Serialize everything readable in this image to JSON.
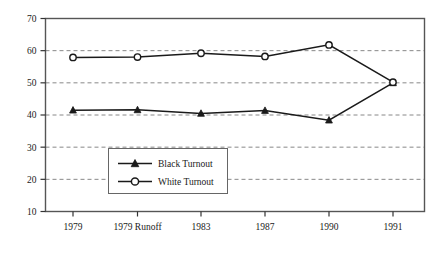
{
  "chart_data": {
    "type": "line",
    "title": "",
    "xlabel": "",
    "ylabel": "",
    "categories": [
      "1979",
      "1979 Runoff",
      "1983",
      "1987",
      "1990",
      "1991"
    ],
    "series": [
      {
        "name": "Black Turnout",
        "marker": "filled-triangle",
        "color": "#1a1a1a",
        "values": [
          41.5,
          41.6,
          40.5,
          41.4,
          38.4,
          50.0
        ]
      },
      {
        "name": "White Turnout",
        "marker": "open-circle",
        "color": "#1a1a1a",
        "values": [
          57.9,
          58.0,
          59.2,
          58.2,
          61.8,
          50.2
        ]
      }
    ],
    "ylim": [
      10,
      70
    ],
    "yticks": [
      10,
      20,
      30,
      40,
      50,
      60,
      70
    ],
    "ytick_labels": [
      "10",
      "20",
      "30",
      "40",
      "50",
      "60",
      "70"
    ],
    "grid": true,
    "grid_style": "dashed",
    "grid_color": "#888888",
    "legend_position": "lower-left-inside",
    "frame": true,
    "frame_color": "#555555",
    "background": "#ffffff"
  },
  "legend": {
    "entries": [
      {
        "label": "Black Turnout",
        "marker": "filled-triangle"
      },
      {
        "label": "White Turnout",
        "marker": "open-circle"
      }
    ]
  }
}
